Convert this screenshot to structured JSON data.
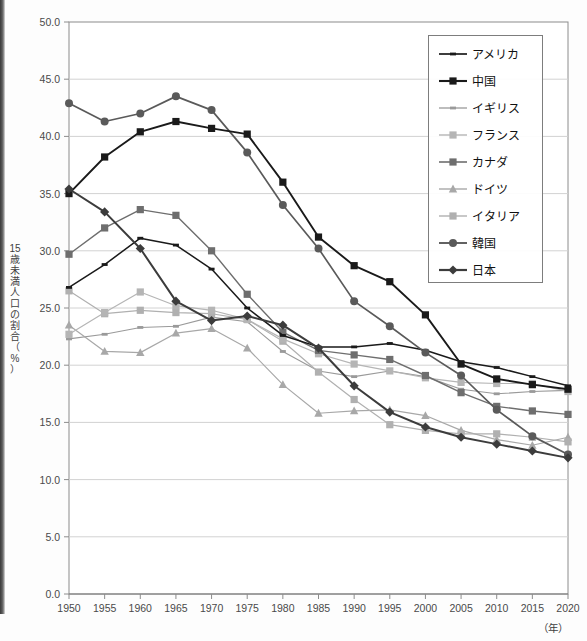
{
  "title_partial": "",
  "axes": {
    "y_label_chars": [
      "15",
      "歳",
      "未",
      "満",
      "人",
      "口",
      "の",
      "割",
      "合",
      "（",
      "%",
      "）"
    ],
    "x_label": "（年）",
    "y_ticks": [
      "50.0",
      "45.0",
      "40.0",
      "35.0",
      "30.0",
      "25.0",
      "20.0",
      "15.0",
      "10.0",
      "5.0",
      "0.0"
    ],
    "x_ticks": [
      "1950",
      "1955",
      "1960",
      "1965",
      "1970",
      "1975",
      "1980",
      "1985",
      "1990",
      "1995",
      "2000",
      "2005",
      "2010",
      "2015",
      "2020"
    ]
  },
  "legend": {
    "items": [
      {
        "label": "アメリカ",
        "color": "#1a1a1a",
        "marker": "none"
      },
      {
        "label": "中国",
        "color": "#1a1a1a",
        "marker": "square"
      },
      {
        "label": "イギリス",
        "color": "#9a9a9a",
        "marker": "none"
      },
      {
        "label": "フランス",
        "color": "#b5b5b5",
        "marker": "square"
      },
      {
        "label": "カナダ",
        "color": "#6e6e6e",
        "marker": "square"
      },
      {
        "label": "ドイツ",
        "color": "#a8a8a8",
        "marker": "triangle"
      },
      {
        "label": "イタリア",
        "color": "#b0b0b0",
        "marker": "square"
      },
      {
        "label": "韓国",
        "color": "#5a5a5a",
        "marker": "circle"
      },
      {
        "label": "日本",
        "color": "#3c3c3c",
        "marker": "diamond"
      }
    ]
  },
  "chart_data": {
    "type": "line",
    "title": "",
    "xlabel": "（年）",
    "ylabel": "15歳未満人口の割合（%）",
    "xlim": [
      1950,
      2020
    ],
    "ylim": [
      0.0,
      50.0
    ],
    "ytick_step": 5.0,
    "grid": true,
    "legend_position": "top-right",
    "x": [
      1950,
      1955,
      1960,
      1965,
      1970,
      1975,
      1980,
      1985,
      1990,
      1995,
      2000,
      2005,
      2010,
      2015,
      2020
    ],
    "series": [
      {
        "name": "アメリカ",
        "color": "#1a1a1a",
        "marker": "none",
        "values": [
          26.8,
          28.8,
          31.1,
          30.5,
          28.4,
          25.0,
          22.6,
          21.6,
          21.6,
          21.9,
          21.3,
          20.3,
          19.8,
          19.0,
          18.2
        ]
      },
      {
        "name": "中国",
        "color": "#1a1a1a",
        "marker": "square",
        "values": [
          35.0,
          38.2,
          40.4,
          41.3,
          40.7,
          40.2,
          36.0,
          31.2,
          28.7,
          27.3,
          24.4,
          20.1,
          18.8,
          18.3,
          17.9
        ]
      },
      {
        "name": "イギリス",
        "color": "#9a9a9a",
        "marker": "none",
        "values": [
          22.3,
          22.7,
          23.3,
          23.4,
          24.2,
          23.8,
          21.2,
          19.5,
          19.0,
          19.5,
          19.0,
          17.9,
          17.5,
          17.7,
          17.8
        ]
      },
      {
        "name": "フランス",
        "color": "#b5b5b5",
        "marker": "square",
        "values": [
          22.7,
          24.6,
          26.4,
          25.2,
          24.8,
          24.0,
          22.3,
          21.0,
          20.1,
          19.5,
          18.9,
          18.5,
          18.4,
          18.4,
          17.7
        ]
      },
      {
        "name": "カナダ",
        "color": "#6e6e6e",
        "marker": "square",
        "values": [
          29.7,
          32.0,
          33.6,
          33.1,
          30.0,
          26.2,
          22.9,
          21.3,
          20.9,
          20.5,
          19.1,
          17.6,
          16.4,
          16.0,
          15.7
        ]
      },
      {
        "name": "ドイツ",
        "color": "#a8a8a8",
        "marker": "triangle",
        "values": [
          23.5,
          21.2,
          21.1,
          22.8,
          23.2,
          21.5,
          18.3,
          15.8,
          16.0,
          16.1,
          15.6,
          14.3,
          13.5,
          13.0,
          13.7
        ]
      },
      {
        "name": "イタリア",
        "color": "#b0b0b0",
        "marker": "square",
        "values": [
          26.5,
          24.5,
          24.8,
          24.6,
          24.5,
          24.0,
          22.1,
          19.4,
          17.0,
          14.8,
          14.3,
          14.0,
          14.0,
          13.7,
          13.3
        ]
      },
      {
        "name": "韓国",
        "color": "#5a5a5a",
        "marker": "circle",
        "values": [
          42.9,
          41.3,
          42.0,
          43.5,
          42.3,
          38.6,
          34.0,
          30.2,
          25.6,
          23.4,
          21.1,
          19.1,
          16.1,
          13.8,
          12.2
        ]
      },
      {
        "name": "日本",
        "color": "#3c3c3c",
        "marker": "diamond",
        "values": [
          35.4,
          33.4,
          30.2,
          25.6,
          23.9,
          24.3,
          23.5,
          21.5,
          18.2,
          15.9,
          14.6,
          13.7,
          13.1,
          12.5,
          11.9
        ]
      }
    ]
  }
}
